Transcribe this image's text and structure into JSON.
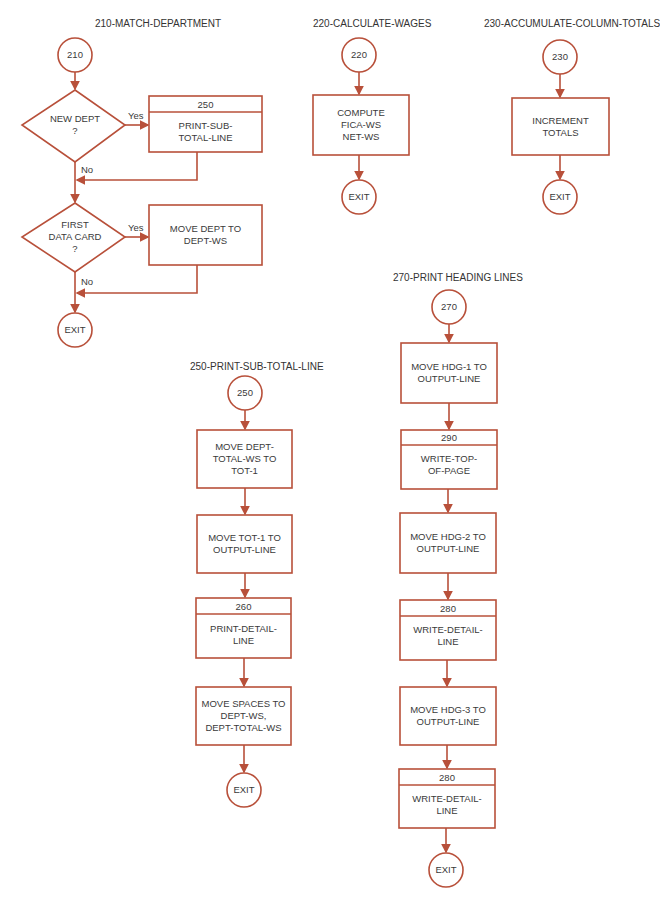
{
  "colors": {
    "stroke": "#b8503a",
    "text": "#3a3a3a",
    "background": "#ffffff"
  },
  "sections": {
    "s210": {
      "title": "210-MATCH-DEPARTMENT",
      "start": "210",
      "decision1": "NEW DEPT\n?",
      "decision1_yes": "Yes",
      "decision1_no": "No",
      "box1_num": "250",
      "box1_text": "PRINT-SUB-\nTOTAL-LINE",
      "decision2": "FIRST\nDATA CARD\n?",
      "decision2_yes": "Yes",
      "decision2_no": "No",
      "box2_text": "MOVE DEPT TO\nDEPT-WS",
      "end": "EXIT"
    },
    "s220": {
      "title": "220-CALCULATE-WAGES",
      "start": "220",
      "box1_text": "COMPUTE\nFICA-WS\nNET-WS",
      "end": "EXIT"
    },
    "s230": {
      "title": "230-ACCUMULATE-COLUMN-TOTALS",
      "start": "230",
      "box1_text": "INCREMENT\nTOTALS",
      "end": "EXIT"
    },
    "s250": {
      "title": "250-PRINT-SUB-TOTAL-LINE",
      "start": "250",
      "box1_text": "MOVE DEPT-\nTOTAL-WS TO\nTOT-1",
      "box2_text": "MOVE TOT-1 TO\nOUTPUT-LINE",
      "box3_num": "260",
      "box3_text": "PRINT-DETAIL-\nLINE",
      "box4_text": "MOVE SPACES TO\nDEPT-WS,\nDEPT-TOTAL-WS",
      "end": "EXIT"
    },
    "s270": {
      "title": "270-PRINT HEADING LINES",
      "start": "270",
      "box1_text": "MOVE HDG-1 TO\nOUTPUT-LINE",
      "box2_num": "290",
      "box2_text": "WRITE-TOP-\nOF-PAGE",
      "box3_text": "MOVE HDG-2 TO\nOUTPUT-LINE",
      "box4_num": "280",
      "box4_text": "WRITE-DETAIL-\nLINE",
      "box5_text": "MOVE HDG-3 TO\nOUTPUT-LINE",
      "box6_num": "280",
      "box6_text": "WRITE-DETAIL-\nLINE",
      "end": "EXIT"
    }
  }
}
